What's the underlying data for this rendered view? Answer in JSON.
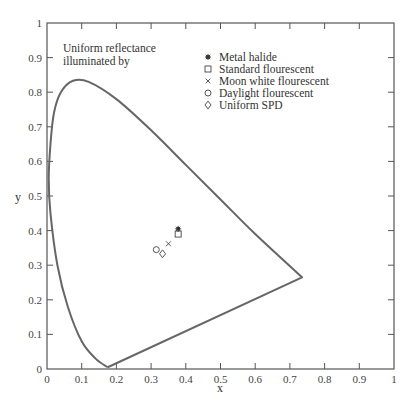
{
  "chart_data": {
    "type": "scatter",
    "title": "",
    "xlabel": "x",
    "ylabel": "y",
    "xlim": [
      0,
      1
    ],
    "ylim": [
      0,
      1
    ],
    "grid": false,
    "legend_position": "upper-right-inside",
    "x_ticks": [
      "0",
      "0.1",
      "0.2",
      "0.3",
      "0.4",
      "0.5",
      "0.6",
      "0.7",
      "0.8",
      "0.9",
      "1"
    ],
    "y_ticks": [
      "0",
      "0.1",
      "0.2",
      "0.3",
      "0.4",
      "0.5",
      "0.6",
      "0.7",
      "0.8",
      "0.9",
      "1"
    ],
    "annotation": [
      "Uniform reflectance",
      "illuminated by"
    ],
    "spectral_locus": {
      "description": "CIE 1931 chromaticity diagram horseshoe outline",
      "points": [
        [
          0.175,
          0.005
        ],
        [
          0.14,
          0.03
        ],
        [
          0.1,
          0.08
        ],
        [
          0.06,
          0.18
        ],
        [
          0.03,
          0.3
        ],
        [
          0.01,
          0.45
        ],
        [
          0.005,
          0.55
        ],
        [
          0.01,
          0.65
        ],
        [
          0.02,
          0.74
        ],
        [
          0.04,
          0.8
        ],
        [
          0.075,
          0.833
        ],
        [
          0.12,
          0.83
        ],
        [
          0.2,
          0.78
        ],
        [
          0.3,
          0.69
        ],
        [
          0.4,
          0.59
        ],
        [
          0.5,
          0.49
        ],
        [
          0.6,
          0.39
        ],
        [
          0.735,
          0.265
        ],
        [
          0.175,
          0.005
        ]
      ]
    },
    "series": [
      {
        "name": "Metal halide",
        "marker": "asterisk",
        "x": 0.378,
        "y": 0.405
      },
      {
        "name": "Standard flourescent",
        "marker": "square",
        "x": 0.378,
        "y": 0.39
      },
      {
        "name": "Moon white flourescent",
        "marker": "x",
        "x": 0.35,
        "y": 0.362
      },
      {
        "name": "Daylight flourescent",
        "marker": "circle",
        "x": 0.315,
        "y": 0.345
      },
      {
        "name": "Uniform SPD",
        "marker": "diamond",
        "x": 0.333,
        "y": 0.333
      }
    ]
  }
}
